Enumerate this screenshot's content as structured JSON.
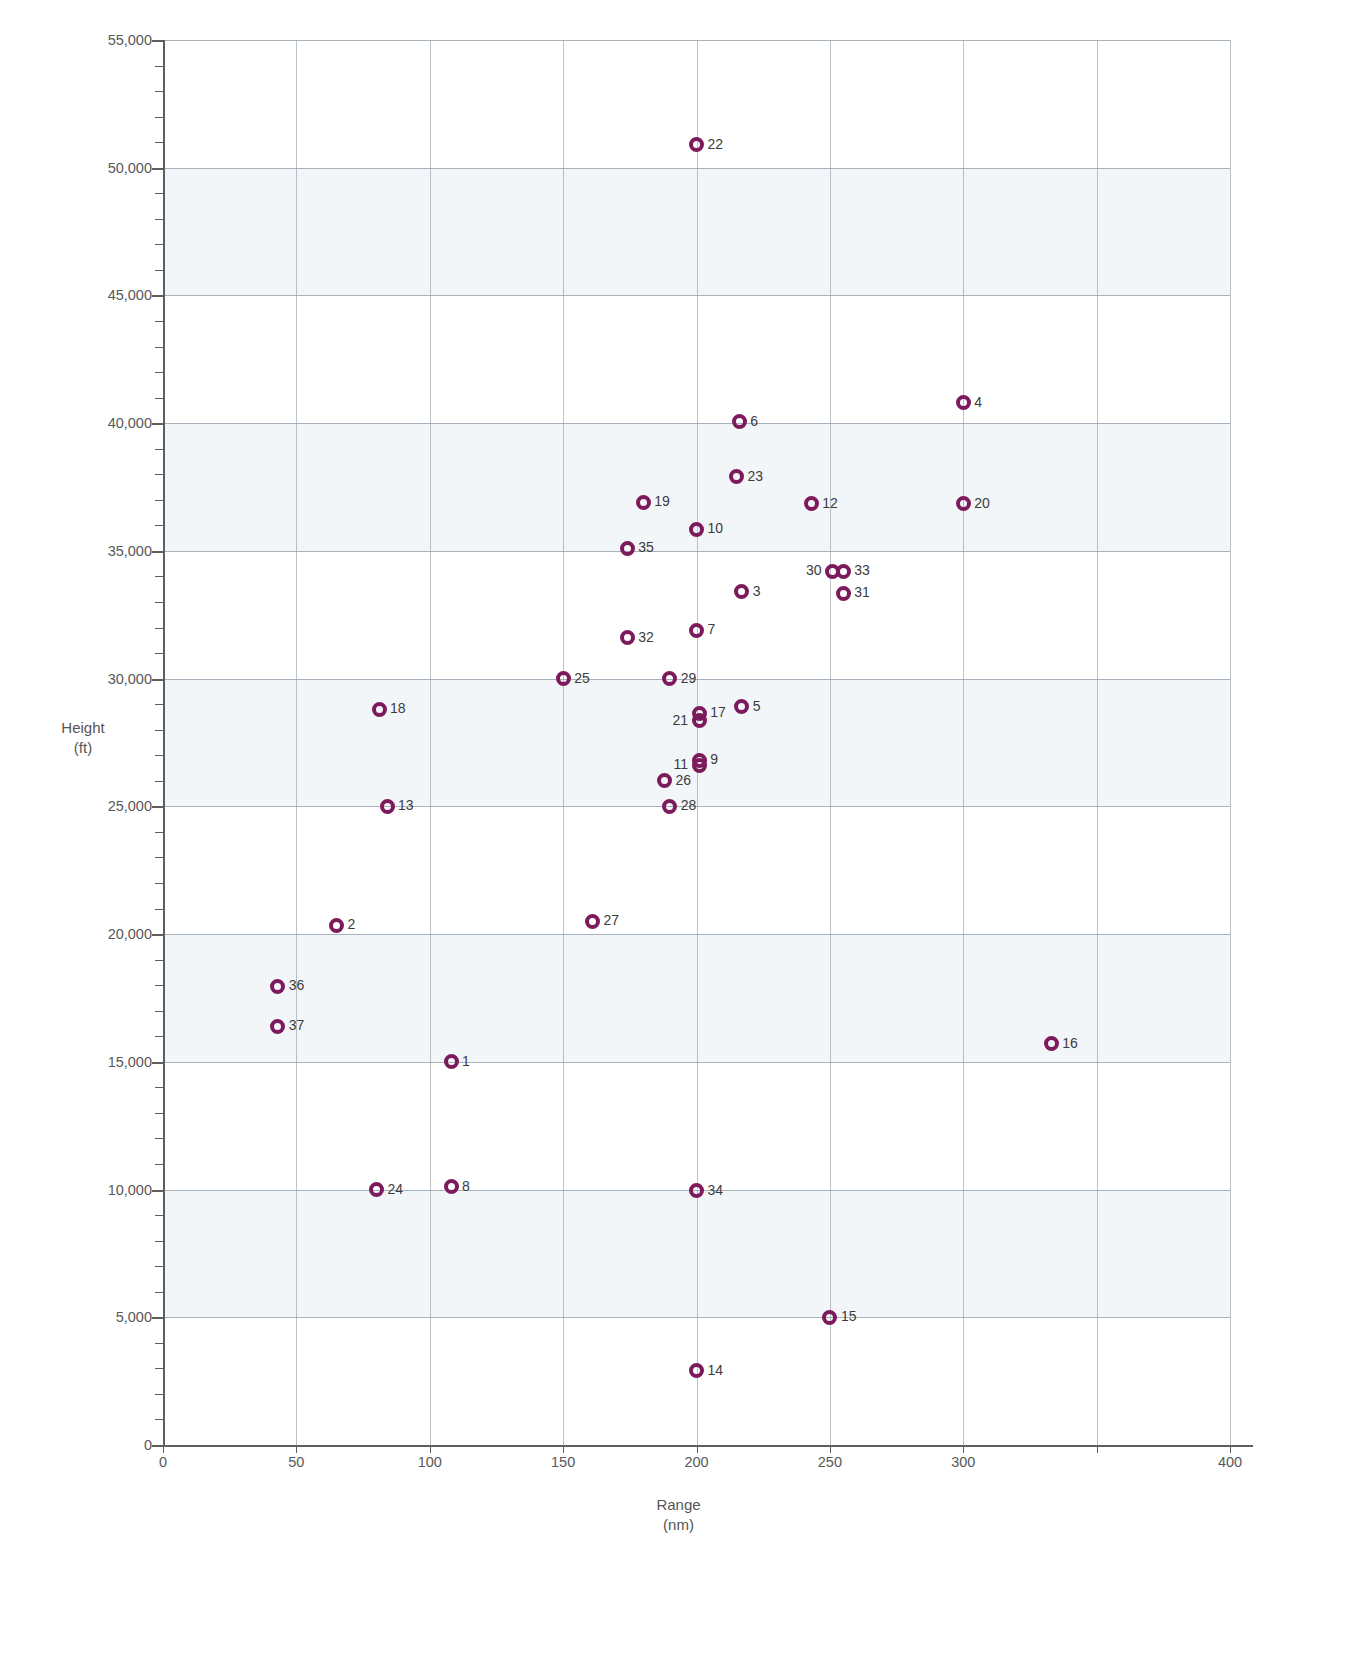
{
  "chart_data": {
    "type": "scatter",
    "title": "",
    "xlabel": "Range",
    "xunit": "(nm)",
    "ylabel": "Height",
    "yunit": "(ft)",
    "xlim": [
      0,
      400
    ],
    "ylim": [
      0,
      55000
    ],
    "xticks": [
      0,
      50,
      100,
      150,
      200,
      250,
      300,
      350,
      400
    ],
    "xtick_labels": [
      "0",
      "50",
      "100",
      "150",
      "200",
      "250",
      "300",
      "",
      "400"
    ],
    "yticks": [
      0,
      5000,
      10000,
      15000,
      20000,
      25000,
      30000,
      35000,
      40000,
      45000,
      50000,
      55000
    ],
    "ytick_labels": [
      "0",
      "5,000",
      "10,000",
      "15,000",
      "20,000",
      "25,000",
      "30,000",
      "35,000",
      "40,000",
      "45,000",
      "50,000",
      "55,000"
    ],
    "grid": true,
    "legend": "none",
    "marker_color": "#7d1a5c",
    "band_color": "#eef3f7",
    "shaded_bands": [
      [
        5000,
        10000
      ],
      [
        15000,
        20000
      ],
      [
        25000,
        30000
      ],
      [
        35000,
        40000
      ],
      [
        45000,
        50000
      ]
    ],
    "points": [
      {
        "label": "1",
        "x": 108,
        "y": 15000,
        "side": "right"
      },
      {
        "label": "2",
        "x": 65,
        "y": 20350,
        "side": "right"
      },
      {
        "label": "3",
        "x": 217,
        "y": 33400,
        "side": "right"
      },
      {
        "label": "4",
        "x": 300,
        "y": 40800,
        "side": "right"
      },
      {
        "label": "5",
        "x": 217,
        "y": 28900,
        "side": "right"
      },
      {
        "label": "6",
        "x": 216,
        "y": 40050,
        "side": "right"
      },
      {
        "label": "7",
        "x": 200,
        "y": 31900,
        "side": "right"
      },
      {
        "label": "8",
        "x": 108,
        "y": 10100,
        "side": "right"
      },
      {
        "label": "9",
        "x": 201,
        "y": 26800,
        "side": "right"
      },
      {
        "label": "10",
        "x": 200,
        "y": 35850,
        "side": "right"
      },
      {
        "label": "11",
        "x": 201,
        "y": 26600,
        "side": "left"
      },
      {
        "label": "12",
        "x": 243,
        "y": 36850,
        "side": "right"
      },
      {
        "label": "13",
        "x": 84,
        "y": 25000,
        "side": "right"
      },
      {
        "label": "14",
        "x": 200,
        "y": 2900,
        "side": "right"
      },
      {
        "label": "15",
        "x": 250,
        "y": 5000,
        "side": "right"
      },
      {
        "label": "16",
        "x": 333,
        "y": 15700,
        "side": "right"
      },
      {
        "label": "17",
        "x": 201,
        "y": 28650,
        "side": "right"
      },
      {
        "label": "18",
        "x": 81,
        "y": 28800,
        "side": "right"
      },
      {
        "label": "19",
        "x": 180,
        "y": 36900,
        "side": "right"
      },
      {
        "label": "20",
        "x": 300,
        "y": 36850,
        "side": "right"
      },
      {
        "label": "21",
        "x": 201,
        "y": 28350,
        "side": "left"
      },
      {
        "label": "22",
        "x": 200,
        "y": 50900,
        "side": "right"
      },
      {
        "label": "23",
        "x": 215,
        "y": 37900,
        "side": "right"
      },
      {
        "label": "24",
        "x": 80,
        "y": 10000,
        "side": "right"
      },
      {
        "label": "25",
        "x": 150,
        "y": 30000,
        "side": "right"
      },
      {
        "label": "26",
        "x": 188,
        "y": 26000,
        "side": "right"
      },
      {
        "label": "27",
        "x": 161,
        "y": 20500,
        "side": "right"
      },
      {
        "label": "28",
        "x": 190,
        "y": 25000,
        "side": "right"
      },
      {
        "label": "29",
        "x": 190,
        "y": 30000,
        "side": "right"
      },
      {
        "label": "30",
        "x": 251,
        "y": 34200,
        "side": "left"
      },
      {
        "label": "31",
        "x": 255,
        "y": 33350,
        "side": "right"
      },
      {
        "label": "32",
        "x": 174,
        "y": 31600,
        "side": "right"
      },
      {
        "label": "33",
        "x": 255,
        "y": 34200,
        "side": "right"
      },
      {
        "label": "34",
        "x": 200,
        "y": 9950,
        "side": "right"
      },
      {
        "label": "35",
        "x": 174,
        "y": 35100,
        "side": "right"
      },
      {
        "label": "36",
        "x": 43,
        "y": 17950,
        "side": "right"
      },
      {
        "label": "37",
        "x": 43,
        "y": 16400,
        "side": "right"
      }
    ]
  }
}
